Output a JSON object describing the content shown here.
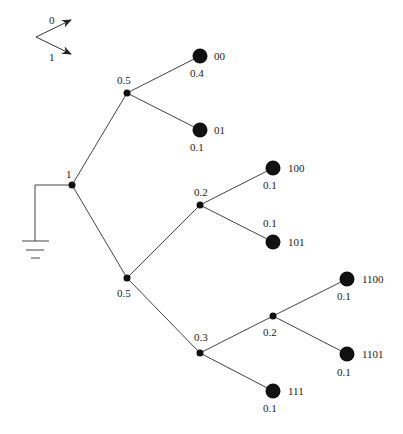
{
  "diagram": {
    "type": "huffman-code-tree",
    "legend": {
      "upper_branch_label": "0",
      "lower_branch_label": "1"
    },
    "colors": {
      "line": "#444444",
      "node": "#111111",
      "background": "#ffffff"
    },
    "root": {
      "id": "root",
      "prob": "1"
    },
    "internal_nodes": [
      {
        "id": "n0",
        "prob": "0.5"
      },
      {
        "id": "n1",
        "prob": "0.5"
      },
      {
        "id": "n10",
        "prob": "0.2"
      },
      {
        "id": "n11",
        "prob": "0.3"
      },
      {
        "id": "n110",
        "prob": "0.2"
      }
    ],
    "leaves": [
      {
        "id": "leaf-00",
        "code": "00",
        "prob": "0.4"
      },
      {
        "id": "leaf-01",
        "code": "01",
        "prob": "0.1"
      },
      {
        "id": "leaf-100",
        "code": "100",
        "prob": "0.1"
      },
      {
        "id": "leaf-101",
        "code": "101",
        "prob": "0.1"
      },
      {
        "id": "leaf-1100",
        "code": "1100",
        "prob": "0.1"
      },
      {
        "id": "leaf-1101",
        "code": "1101",
        "prob": "0.1"
      },
      {
        "id": "leaf-111",
        "code": "111",
        "prob": "0.1"
      }
    ],
    "ground_symbol": "ground"
  }
}
